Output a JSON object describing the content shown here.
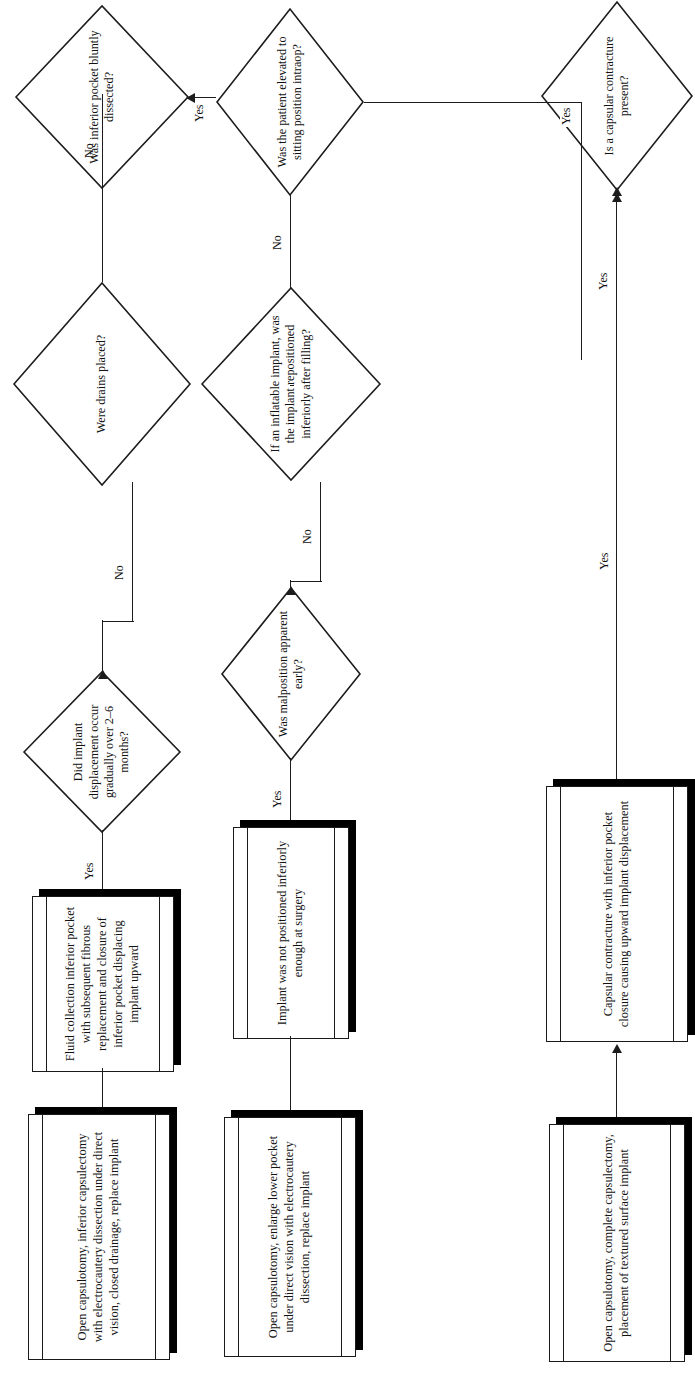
{
  "diagram": {
    "type": "clinical-decision-flowchart",
    "orientation": "rotated-90-ccw",
    "headings": {
      "probable_cause": "Probable Cause",
      "correction": "Correction"
    },
    "decisions": [
      {
        "id": "d-capsular-contracture",
        "text": "Is a capsular contracture present?"
      },
      {
        "id": "d-sitting-position",
        "text": "Was the patient elevated to sitting position intraop?"
      },
      {
        "id": "d-inflatable-repositioned",
        "text": "If an inflatable implant, was the implant repositioned inferiorly after filling?"
      },
      {
        "id": "d-malposition-early",
        "text": "Was malposition apparent early?"
      },
      {
        "id": "d-pocket-bluntly-dissected",
        "text": "Was inferior pocket bluntly dissected?"
      },
      {
        "id": "d-drains-placed",
        "text": "Were drains placed?"
      },
      {
        "id": "d-gradual-displacement",
        "text": "Did implant displacement occur gradually over 2–6 months?"
      }
    ],
    "causes": [
      {
        "id": "c-capsular-contracture",
        "text": "Capsular contracture with inferior pocket closure causing upward implant displacement"
      },
      {
        "id": "c-implant-not-positioned",
        "text": "Implant was not positioned inferiorly enough at surgery"
      },
      {
        "id": "c-fluid-collection",
        "text": "Fluid collection inferior pocket with subsequent fibrous replacement and closure of inferior pocket displacing implant upward"
      }
    ],
    "corrections": [
      {
        "id": "x-open-capsulotomy-textured",
        "text": "Open capsulotomy, complete capsulectomy, placement of textured surface implant"
      },
      {
        "id": "x-enlarge-lower-pocket",
        "text": "Open capsulotomy, enlarge lower pocket under direct vision with electrocautery dissection, replace implant"
      },
      {
        "id": "x-inferior-capsulectomy",
        "text": "Open capsulotomy, inferior capsulectomy with electrocautery dissection under direct vision, closed drainage, replace implant"
      }
    ],
    "edge_labels": {
      "yes": "Yes",
      "no": "No"
    },
    "edges": [
      {
        "from": "d-capsular-contracture",
        "to": "c-capsular-contracture",
        "label": "Yes"
      },
      {
        "from": "d-capsular-contracture",
        "to": "d-sitting-position",
        "label": ""
      },
      {
        "from": "d-sitting-position",
        "to": "d-inflatable-repositioned",
        "label": "No"
      },
      {
        "from": "d-sitting-position",
        "to": "d-malposition-early",
        "label": "Yes"
      },
      {
        "from": "d-inflatable-repositioned",
        "to": "d-malposition-early",
        "label": "No"
      },
      {
        "from": "d-malposition-early",
        "to": "c-implant-not-positioned",
        "label": "Yes"
      },
      {
        "from": "d-sitting-position",
        "to": "d-pocket-bluntly-dissected",
        "label": "Yes"
      },
      {
        "from": "d-pocket-bluntly-dissected",
        "to": "d-drains-placed",
        "label": "Yes"
      },
      {
        "from": "d-pocket-bluntly-dissected",
        "to": "d-gradual-displacement",
        "label": "No"
      },
      {
        "from": "d-drains-placed",
        "to": "d-gradual-displacement",
        "label": "No"
      },
      {
        "from": "d-gradual-displacement",
        "to": "c-fluid-collection",
        "label": "Yes"
      },
      {
        "from": "c-capsular-contracture",
        "to": "x-open-capsulotomy-textured",
        "label": ""
      },
      {
        "from": "c-implant-not-positioned",
        "to": "x-enlarge-lower-pocket",
        "label": ""
      },
      {
        "from": "c-fluid-collection",
        "to": "x-inferior-capsulectomy",
        "label": ""
      }
    ],
    "colors": {
      "stroke": "#1d1d1d",
      "shadow": "#000000",
      "background": "#ffffff",
      "text": "#111111"
    }
  }
}
